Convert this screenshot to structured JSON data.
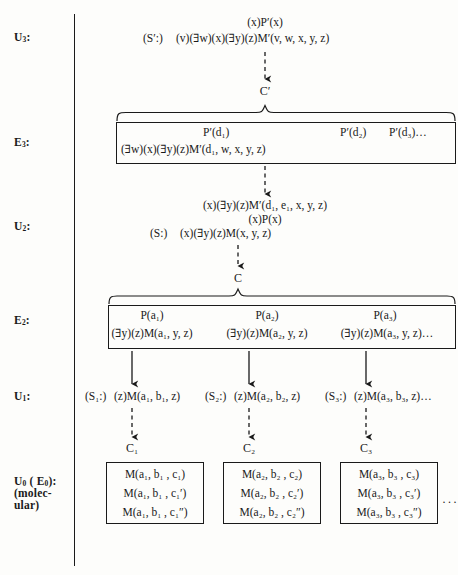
{
  "diagram": {
    "line_color": "#1a1a1a",
    "background": "#fdfdfb",
    "row_labels": [
      {
        "id": "u3",
        "text": "U",
        "sub": "3",
        "suffix": ":"
      },
      {
        "id": "e3",
        "text": "E",
        "sub": "3",
        "suffix": ":"
      },
      {
        "id": "u2",
        "text": "U",
        "sub": "2",
        "suffix": ":"
      },
      {
        "id": "e2",
        "text": "E",
        "sub": "2",
        "suffix": ":"
      },
      {
        "id": "u1",
        "text": "U",
        "sub": "1",
        "suffix": ":"
      },
      {
        "id": "u0",
        "text": "U",
        "sub": "0",
        "suffix": " ( E",
        "sub2": "0",
        "suffix2": "):"
      },
      {
        "id": "u0b",
        "text": "(molec-"
      },
      {
        "id": "u0c",
        "text": "ular)"
      }
    ],
    "u3_row": {
      "line1": "(x)P′(x)",
      "line2_prefix": "(S′:)",
      "line2_body": "(v)(∃w)(x)(∃y)(z)M′(v, w, x, y, z)"
    },
    "c_prime_node": "C′",
    "e3_box": {
      "top_line_1": "P′(d₁)",
      "top_line_2": "P′(d₂)",
      "top_line_3": "P′(d₃)…",
      "bottom_line": "(∃w)(x)(∃y)(z)M′(d₁, w, x, y, z)"
    },
    "u2_row": {
      "line1": "(x)(∃y)(z)M′(d₁, e₁, x, y, z)",
      "line2": "(x)P(x)",
      "line3_prefix": "(S:)",
      "line3_body": "(x)(∃y)(z)M(x, y, z)"
    },
    "c_node": "C",
    "e2_box": {
      "cells": [
        {
          "top": "P(a₁)",
          "bottom": "(∃y)(z)M(a₁, y, z)"
        },
        {
          "top": "P(a₂)",
          "bottom": "(∃y)(z)M(a₂, y, z)"
        },
        {
          "top": "P(a₃)",
          "bottom": "(∃y)(z)M(a₃, y, z)…"
        }
      ]
    },
    "u1_row": {
      "cells": [
        {
          "prefix": "(S₁:)",
          "body": "(z)M(a₁, b₁, z)"
        },
        {
          "prefix": "(S₂:)",
          "body": "(z)M(a₂, b₂, z)"
        },
        {
          "prefix": "(S₃:)",
          "body": "(z)M(a₃, b₃, z)…"
        }
      ]
    },
    "c_sub_nodes": [
      "C₁",
      "C₂",
      "C₃"
    ],
    "u0_boxes": [
      {
        "lines": [
          "M(a₁, b₁ , c₁)",
          "M(a₁, b₁ , c₁′)",
          "M(a₁, b₁ , c₁″)"
        ]
      },
      {
        "lines": [
          "M(a₂, b₂ , c₂)",
          "M(a₂, b₂ , c₂′)",
          "M(a₂, b₂ , c₂″)"
        ]
      },
      {
        "lines": [
          "M(a₃, b₃ , c₃)",
          "M(a₃, b₃ , c₃′)",
          "M(a₃, b₃ , c₃″)"
        ]
      }
    ],
    "trailing_ellipsis": "···"
  }
}
